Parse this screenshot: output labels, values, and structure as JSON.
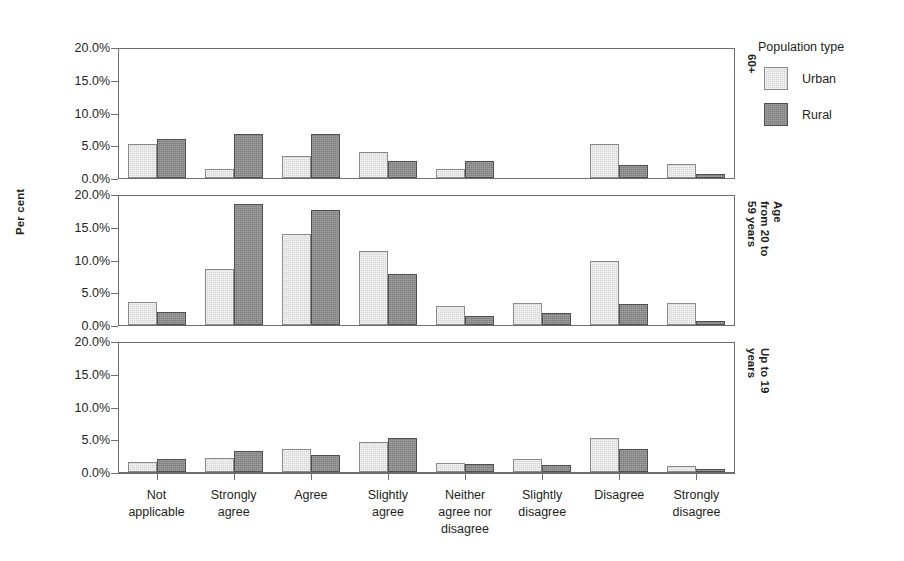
{
  "chart_data": {
    "type": "bar",
    "title": "",
    "xlabel": "",
    "ylabel": "Per cent",
    "ylim": [
      0,
      20
    ],
    "grid": false,
    "legend_position": "right",
    "legend_title": "Population type",
    "ytick_labels": [
      "0.0%",
      "5.0%",
      "10.0%",
      "15.0%",
      "20.0%"
    ],
    "ytick_values": [
      0,
      5,
      10,
      15,
      20
    ],
    "categories": [
      "Not\napplicable",
      "Strongly\nagree",
      "Agree",
      "Slightly\nagree",
      "Neither\nagree nor\ndisagree",
      "Slightly\ndisagree",
      "Disagree",
      "Strongly\ndisagree"
    ],
    "series_names": [
      "Urban",
      "Rural"
    ],
    "series_colors": [
      "#d4d4d4",
      "#7b7b7b"
    ],
    "panels": [
      {
        "label": "60+",
        "series": [
          {
            "name": "Urban",
            "values": [
              5.3,
              1.4,
              3.4,
              4.1,
              1.4,
              0.0,
              5.3,
              2.1
            ]
          },
          {
            "name": "Rural",
            "values": [
              6.0,
              6.8,
              6.8,
              2.7,
              2.7,
              0.0,
              2.0,
              0.6
            ]
          }
        ]
      },
      {
        "label": "Age\nfrom 20 to\n59 years",
        "series": [
          {
            "name": "Urban",
            "values": [
              3.5,
              8.7,
              14.1,
              11.5,
              2.9,
              3.4,
              10.0,
              3.4
            ]
          },
          {
            "name": "Rural",
            "values": [
              2.0,
              18.8,
              17.9,
              7.9,
              1.4,
              1.8,
              3.2,
              0.7
            ]
          }
        ]
      },
      {
        "label": "Up to 19\nyears",
        "series": [
          {
            "name": "Urban",
            "values": [
              1.6,
              2.2,
              3.5,
              4.7,
              1.4,
              2.0,
              5.3,
              0.9
            ]
          },
          {
            "name": "Rural",
            "values": [
              2.0,
              3.2,
              2.7,
              5.2,
              1.2,
              1.1,
              3.6,
              0.5
            ]
          }
        ]
      }
    ]
  },
  "legend": {
    "title": "Population type",
    "items": [
      {
        "label": "Urban",
        "swatch": "urban"
      },
      {
        "label": "Rural",
        "swatch": "rural"
      }
    ]
  }
}
